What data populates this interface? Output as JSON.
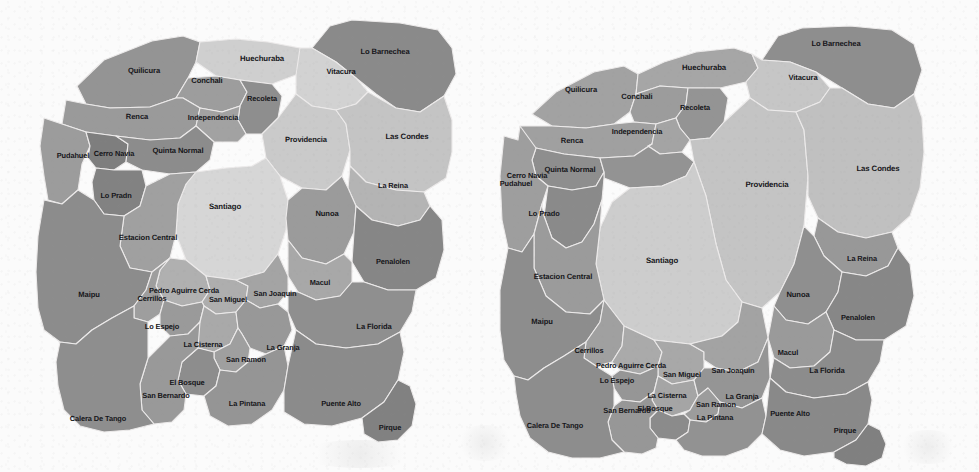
{
  "figure": {
    "kind": "choropleth-map-pair",
    "region": "Santiago Metropolitan Region, Chile",
    "background_color": "#fbfbfb",
    "border_color": "#eceaea",
    "label_color": "#16161a"
  },
  "palette": {
    "lightest": "#d8d8d8",
    "light": "#c9c9c9",
    "mid_light": "#b8b8b8",
    "mid": "#a6a6a6",
    "mid_dark": "#949494",
    "dark": "#868686",
    "darker": "#787878",
    "darkest": "#6d6d6d"
  },
  "maps": [
    {
      "id": "map-left",
      "panel_name": "left-choropleth-map",
      "comunas": [
        {
          "name": "Quilicura",
          "fill": "#949494",
          "label_x": 144,
          "label_y": 71,
          "font": 7.6
        },
        {
          "name": "Huechuraba",
          "fill": "#cfcfcf",
          "label_x": 262,
          "label_y": 59,
          "font": 7.8
        },
        {
          "name": "Conchali",
          "fill": "#9d9d9d",
          "label_x": 207,
          "label_y": 81,
          "font": 7.6
        },
        {
          "name": "Recoleta",
          "fill": "#8e8e8e",
          "label_x": 262,
          "label_y": 99,
          "font": 7.4
        },
        {
          "name": "Lo Barnechea",
          "fill": "#8a8a8a",
          "label_x": 385,
          "label_y": 52,
          "font": 7.6
        },
        {
          "name": "Vitacura",
          "fill": "#d2d2d2",
          "label_x": 341,
          "label_y": 72,
          "font": 7.6
        },
        {
          "name": "Renca",
          "fill": "#9a9a9a",
          "label_x": 137,
          "label_y": 117,
          "font": 7.6
        },
        {
          "name": "Independencia",
          "fill": "#a2a2a2",
          "label_x": 213,
          "label_y": 118,
          "font": 7.4
        },
        {
          "name": "Providencia",
          "fill": "#cacaca",
          "label_x": 306,
          "label_y": 140,
          "font": 7.6
        },
        {
          "name": "Las Condes",
          "fill": "#c4c4c4",
          "label_x": 407,
          "label_y": 137,
          "font": 7.8
        },
        {
          "name": "Pudahuel",
          "fill": "#9c9c9c",
          "label_x": 73,
          "label_y": 156,
          "font": 7.4
        },
        {
          "name": "Cerro Navia",
          "fill": "#7e7e7e",
          "label_x": 114,
          "label_y": 154,
          "font": 7.4
        },
        {
          "name": "Quinta Normal",
          "fill": "#8c8c8c",
          "label_x": 178,
          "label_y": 151,
          "font": 7.6
        },
        {
          "name": "La Reina",
          "fill": "#b4b4b4",
          "label_x": 393,
          "label_y": 186,
          "font": 7.4
        },
        {
          "name": "Lo Pradn",
          "fill": "#828282",
          "label_x": 116,
          "label_y": 196,
          "font": 7.4
        },
        {
          "name": "Santiago",
          "fill": "#d6d6d6",
          "label_x": 225,
          "label_y": 207,
          "font": 7.8
        },
        {
          "name": "Nunoa",
          "fill": "#9b9b9b",
          "label_x": 327,
          "label_y": 214,
          "font": 7.6
        },
        {
          "name": "Estacion Central",
          "fill": "#a0a0a0",
          "label_x": 148,
          "label_y": 238,
          "font": 7.6
        },
        {
          "name": "Penalolen",
          "fill": "#868686",
          "label_x": 393,
          "label_y": 262,
          "font": 7.4
        },
        {
          "name": "Macul",
          "fill": "#a8a8a8",
          "label_x": 320,
          "label_y": 283,
          "font": 7.4
        },
        {
          "name": "Maipu",
          "fill": "#8c8c8c",
          "label_x": 89,
          "label_y": 295,
          "font": 7.6
        },
        {
          "name": "Pedro Aguirre Cerda",
          "fill": "#b0b0b0",
          "label_x": 184,
          "label_y": 291,
          "font": 7.4
        },
        {
          "name": "Cerrillos",
          "fill": "#9e9e9e",
          "label_x": 152,
          "label_y": 299,
          "font": 7.4
        },
        {
          "name": "San Miguel",
          "fill": "#aeaeae",
          "label_x": 228,
          "label_y": 300,
          "font": 7.4
        },
        {
          "name": "San Joaquin",
          "fill": "#a4a4a4",
          "label_x": 275,
          "label_y": 294,
          "font": 7.4
        },
        {
          "name": "Lo Espejo",
          "fill": "#9a9a9a",
          "label_x": 162,
          "label_y": 327,
          "font": 7.4
        },
        {
          "name": "La Cisterna",
          "fill": "#a9a9a9",
          "label_x": 203,
          "label_y": 345,
          "font": 7.4
        },
        {
          "name": "La Florida",
          "fill": "#8f8f8f",
          "label_x": 374,
          "label_y": 327,
          "font": 7.6
        },
        {
          "name": "La Granja",
          "fill": "#989898",
          "label_x": 283,
          "label_y": 348,
          "font": 7.4
        },
        {
          "name": "San Ramon",
          "fill": "#9f9f9f",
          "label_x": 246,
          "label_y": 360,
          "font": 7.4
        },
        {
          "name": "El Bosque",
          "fill": "#8d8d8d",
          "label_x": 187,
          "label_y": 383,
          "font": 7.4
        },
        {
          "name": "San Bernardo",
          "fill": "#999999",
          "label_x": 166,
          "label_y": 396,
          "font": 7.4
        },
        {
          "name": "La Pintana",
          "fill": "#959595",
          "label_x": 247,
          "label_y": 404,
          "font": 7.4
        },
        {
          "name": "Puente Alto",
          "fill": "#8b8b8b",
          "label_x": 341,
          "label_y": 404,
          "font": 7.4
        },
        {
          "name": "Calera De Tango",
          "fill": "#8e8e8e",
          "label_x": 98,
          "label_y": 419,
          "font": 7.4
        },
        {
          "name": "Pirque",
          "fill": "#818181",
          "label_x": 390,
          "label_y": 428,
          "font": 7.4
        }
      ]
    },
    {
      "id": "map-right",
      "panel_name": "right-choropleth-map",
      "comunas": [
        {
          "name": "Quilicura",
          "fill": "#a2a2a2",
          "label_x": 91,
          "label_y": 90,
          "font": 7.6
        },
        {
          "name": "Huechuraba",
          "fill": "#a6a6a6",
          "label_x": 214,
          "label_y": 68,
          "font": 7.8
        },
        {
          "name": "Conchali",
          "fill": "#9c9c9c",
          "label_x": 147,
          "label_y": 97,
          "font": 7.6
        },
        {
          "name": "Recoleta",
          "fill": "#949494",
          "label_x": 205,
          "label_y": 108,
          "font": 7.4
        },
        {
          "name": "Lo Barnechea",
          "fill": "#8e8e8e",
          "label_x": 346,
          "label_y": 44,
          "font": 7.6
        },
        {
          "name": "Vitacura",
          "fill": "#c6c6c6",
          "label_x": 313,
          "label_y": 78,
          "font": 7.6
        },
        {
          "name": "Renca",
          "fill": "#a0a0a0",
          "label_x": 82,
          "label_y": 141,
          "font": 7.6
        },
        {
          "name": "Independencia",
          "fill": "#a4a4a4",
          "label_x": 147,
          "label_y": 132,
          "font": 7.4
        },
        {
          "name": "Providencia",
          "fill": "#c4c4c4",
          "label_x": 277,
          "label_y": 185,
          "font": 7.8
        },
        {
          "name": "Las Condes",
          "fill": "#c0c0c0",
          "label_x": 388,
          "label_y": 169,
          "font": 7.8
        },
        {
          "name": "Cerro Navia",
          "fill": "#8e8e8e",
          "label_x": 37,
          "label_y": 176,
          "font": 7.4
        },
        {
          "name": "Pudahuel",
          "fill": "#9e9e9e",
          "label_x": 26,
          "label_y": 184,
          "font": 7.4
        },
        {
          "name": "Quinta Normal",
          "fill": "#939393",
          "label_x": 80,
          "label_y": 170,
          "font": 7.6
        },
        {
          "name": "La Reina",
          "fill": "#989898",
          "label_x": 372,
          "label_y": 259,
          "font": 7.4
        },
        {
          "name": "Lo Prado",
          "fill": "#8a8a8a",
          "label_x": 54,
          "label_y": 214,
          "font": 7.4
        },
        {
          "name": "Santiago",
          "fill": "#cdcdcd",
          "label_x": 172,
          "label_y": 261,
          "font": 7.8
        },
        {
          "name": "Nunoa",
          "fill": "#8f8f8f",
          "label_x": 308,
          "label_y": 295,
          "font": 7.6
        },
        {
          "name": "Estacion Central",
          "fill": "#9b9b9b",
          "label_x": 73,
          "label_y": 277,
          "font": 7.6
        },
        {
          "name": "Penalolen",
          "fill": "#878787",
          "label_x": 368,
          "label_y": 318,
          "font": 7.4
        },
        {
          "name": "Macul",
          "fill": "#9a9a9a",
          "label_x": 298,
          "label_y": 353,
          "font": 7.4
        },
        {
          "name": "Maipu",
          "fill": "#8d8d8d",
          "label_x": 52,
          "label_y": 322,
          "font": 7.6
        },
        {
          "name": "Cerrillos",
          "fill": "#a0a0a0",
          "label_x": 99,
          "label_y": 351,
          "font": 7.4
        },
        {
          "name": "Pedro Aguirre Cerda",
          "fill": "#aaaaaa",
          "label_x": 141,
          "label_y": 366,
          "font": 7.4
        },
        {
          "name": "San Miguel",
          "fill": "#a8a8a8",
          "label_x": 192,
          "label_y": 375,
          "font": 7.4
        },
        {
          "name": "San Joaquin",
          "fill": "#a3a3a3",
          "label_x": 243,
          "label_y": 371,
          "font": 7.4
        },
        {
          "name": "Lo Espejo",
          "fill": "#969696",
          "label_x": 127,
          "label_y": 381,
          "font": 7.4
        },
        {
          "name": "La Cisterna",
          "fill": "#a5a5a5",
          "label_x": 177,
          "label_y": 396,
          "font": 7.4
        },
        {
          "name": "La Florida",
          "fill": "#8c8c8c",
          "label_x": 337,
          "label_y": 371,
          "font": 7.6
        },
        {
          "name": "La Granja",
          "fill": "#959595",
          "label_x": 252,
          "label_y": 397,
          "font": 7.4
        },
        {
          "name": "San Ramon",
          "fill": "#9c9c9c",
          "label_x": 226,
          "label_y": 405,
          "font": 7.4
        },
        {
          "name": "El Bosque",
          "fill": "#8b8b8b",
          "label_x": 165,
          "label_y": 409,
          "font": 7.4
        },
        {
          "name": "San Bernardo",
          "fill": "#979797",
          "label_x": 137,
          "label_y": 411,
          "font": 7.4
        },
        {
          "name": "La Pintana",
          "fill": "#929292",
          "label_x": 225,
          "label_y": 418,
          "font": 7.4
        },
        {
          "name": "Puente Alto",
          "fill": "#898989",
          "label_x": 300,
          "label_y": 414,
          "font": 7.4
        },
        {
          "name": "Calera De Tango",
          "fill": "#8d8d8d",
          "label_x": 65,
          "label_y": 426,
          "font": 7.4
        },
        {
          "name": "Pirque",
          "fill": "#808080",
          "label_x": 355,
          "label_y": 431,
          "font": 7.4
        }
      ]
    }
  ]
}
